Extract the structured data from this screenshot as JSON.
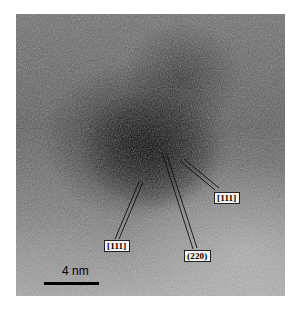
{
  "figure": {
    "type": "HRTEM micrograph",
    "annotations": [
      {
        "id": "label-left",
        "text": "[111]",
        "box": {
          "x": 104,
          "y": 240
        },
        "line_from": [
          117,
          239
        ],
        "line_to": [
          141,
          182
        ]
      },
      {
        "id": "label-center",
        "text": "(220)",
        "box": {
          "x": 184,
          "y": 250
        },
        "line_from": [
          195,
          248
        ],
        "line_to": [
          164,
          152
        ]
      },
      {
        "id": "label-right",
        "text": "[111]",
        "box": {
          "x": 214,
          "y": 192
        },
        "line_from": [
          217,
          189
        ],
        "line_to": [
          182,
          160
        ]
      }
    ],
    "scale_bar": {
      "label": "4 nm",
      "x1": 44,
      "x2": 99,
      "y": 283
    }
  }
}
